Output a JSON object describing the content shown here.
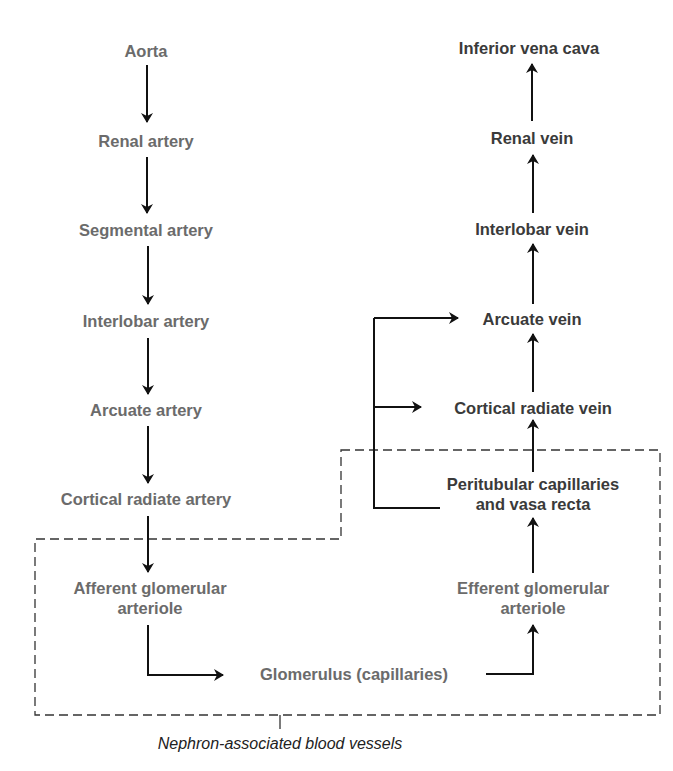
{
  "diagram": {
    "type": "flowchart",
    "colors": {
      "artery_text": "#6b6b6b",
      "vein_text": "#3a3a3a",
      "arrow": "#111111",
      "boundary": "#333333"
    },
    "arterial_path": [
      {
        "id": "aorta",
        "label": "Aorta"
      },
      {
        "id": "renal-artery",
        "label": "Renal artery"
      },
      {
        "id": "segmental-artery",
        "label": "Segmental artery"
      },
      {
        "id": "interlobar-artery",
        "label": "Interlobar artery"
      },
      {
        "id": "arcuate-artery",
        "label": "Arcuate artery"
      },
      {
        "id": "cortical-radiate-artery",
        "label": "Cortical radiate artery"
      },
      {
        "id": "afferent-arteriole",
        "label_line1": "Afferent glomerular",
        "label_line2": "arteriole"
      }
    ],
    "capillary": {
      "id": "glomerulus",
      "label": "Glomerulus (capillaries)"
    },
    "efferent": {
      "id": "efferent-arteriole",
      "label_line1": "Efferent glomerular",
      "label_line2": "arteriole"
    },
    "venous_path": [
      {
        "id": "peritubular",
        "label_line1": "Peritubular capillaries",
        "label_line2": "and vasa recta"
      },
      {
        "id": "cortical-radiate-vein",
        "label": "Cortical radiate vein"
      },
      {
        "id": "arcuate-vein",
        "label": "Arcuate vein"
      },
      {
        "id": "interlobar-vein",
        "label": "Interlobar vein"
      },
      {
        "id": "renal-vein",
        "label": "Renal vein"
      },
      {
        "id": "ivc",
        "label": "Inferior vena cava"
      }
    ],
    "edges": [
      [
        "aorta",
        "renal-artery"
      ],
      [
        "renal-artery",
        "segmental-artery"
      ],
      [
        "segmental-artery",
        "interlobar-artery"
      ],
      [
        "interlobar-artery",
        "arcuate-artery"
      ],
      [
        "arcuate-artery",
        "cortical-radiate-artery"
      ],
      [
        "cortical-radiate-artery",
        "afferent-arteriole"
      ],
      [
        "afferent-arteriole",
        "glomerulus"
      ],
      [
        "glomerulus",
        "efferent-arteriole"
      ],
      [
        "efferent-arteriole",
        "peritubular"
      ],
      [
        "peritubular",
        "cortical-radiate-vein"
      ],
      [
        "peritubular",
        "arcuate-vein"
      ],
      [
        "cortical-radiate-vein",
        "arcuate-vein"
      ],
      [
        "arcuate-vein",
        "interlobar-vein"
      ],
      [
        "interlobar-vein",
        "renal-vein"
      ],
      [
        "renal-vein",
        "ivc"
      ]
    ],
    "boundary_caption": "Nephron-associated blood vessels"
  }
}
